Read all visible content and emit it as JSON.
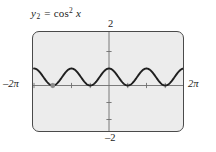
{
  "figure": {
    "function_label": {
      "variable": "y",
      "subscript": "2",
      "equals": "=",
      "function_name": "cos",
      "exponent": "2",
      "argument": "x",
      "full_text": "y2 = cos^2 x"
    },
    "axis_labels": {
      "top": "2",
      "bottom": "–2",
      "left": "–2π",
      "left_number": "–2",
      "left_symbol": "π",
      "right": "2π",
      "right_number": "2",
      "right_symbol": "π"
    },
    "colors": {
      "screen_background": "#ececec",
      "frame_border": "#4a4a4a",
      "curve": "#1f1f1f",
      "axis": "#6e6e6e",
      "point_marker": "#8a8a8a",
      "page_background": "#ffffff",
      "text": "#1c1c1c"
    },
    "marker": {
      "shape": "square-dot",
      "x_value": -4.71238898038469,
      "y_value": 0,
      "description": "highlighted minimum point on curve"
    }
  },
  "chart_data": {
    "type": "line",
    "title": "",
    "subtitle": "",
    "xlabel": "",
    "ylabel": "",
    "expression": "y = cos^2(x)",
    "xlim": [
      -6.283185307179586,
      6.283185307179586
    ],
    "ylim": [
      -2,
      2
    ],
    "xticks": [
      -6.283185307179586,
      -4.71238898038469,
      -3.141592653589793,
      -1.5707963267948966,
      0,
      1.5707963267948966,
      3.141592653589793,
      4.71238898038469,
      6.283185307179586
    ],
    "xtick_labels": [
      "–2π",
      "",
      "",
      "",
      "",
      "",
      "",
      "",
      "2π"
    ],
    "yticks": [
      -2,
      -1,
      0,
      1,
      2
    ],
    "ytick_labels": [
      "–2",
      "",
      "",
      "",
      "2"
    ],
    "grid": false,
    "legend": false,
    "legend_position": "none",
    "series": [
      {
        "name": "y2 = cos^2 x",
        "x": [
          -6.283185307179586,
          -6.021385919380436,
          -5.759586531581287,
          -5.497787143782138,
          -5.235987755982989,
          -4.97418836818384,
          -4.71238898038469,
          -4.450589592585541,
          -4.188790204786391,
          -3.926990816987242,
          -3.665191429188093,
          -3.403392041388944,
          -3.141592653589793,
          -2.879793265790644,
          -2.617993877991495,
          -2.356194490192345,
          -2.094395102393196,
          -1.832595714594047,
          -1.570796326794897,
          -1.308996938995747,
          -1.047197551196598,
          -0.785398163397448,
          -0.523598775598299,
          -0.261799387799149,
          0,
          0.261799387799149,
          0.523598775598299,
          0.785398163397448,
          1.047197551196598,
          1.308996938995747,
          1.570796326794897,
          1.832595714594047,
          2.094395102393196,
          2.356194490192345,
          2.617993877991495,
          2.879793265790644,
          3.141592653589793,
          3.403392041388944,
          3.665191429188093,
          3.926990816987242,
          4.188790204786391,
          4.450589592585541,
          4.71238898038469,
          4.97418836818384,
          5.235987755982989,
          5.497787143782138,
          5.759586531581287,
          6.021385919380436,
          6.283185307179586
        ],
        "y": [
          1,
          0.933012701892219,
          0.75,
          0.5,
          0.25,
          0.066987298107781,
          0,
          0.066987298107781,
          0.25,
          0.5,
          0.75,
          0.933012701892219,
          1,
          0.933012701892219,
          0.75,
          0.5,
          0.25,
          0.066987298107781,
          0,
          0.066987298107781,
          0.25,
          0.5,
          0.75,
          0.933012701892219,
          1,
          0.933012701892219,
          0.75,
          0.5,
          0.25,
          0.066987298107781,
          0,
          0.066987298107781,
          0.25,
          0.5,
          0.75,
          0.933012701892219,
          1,
          0.933012701892219,
          0.75,
          0.5,
          0.25,
          0.066987298107781,
          0,
          0.066987298107781,
          0.25,
          0.5,
          0.75,
          0.933012701892219,
          1
        ],
        "color": "#1f1f1f",
        "width": 1.9
      }
    ],
    "annotations": [
      {
        "type": "point",
        "x": -4.71238898038469,
        "y": 0,
        "label": "",
        "color": "#8a8a8a"
      }
    ]
  }
}
